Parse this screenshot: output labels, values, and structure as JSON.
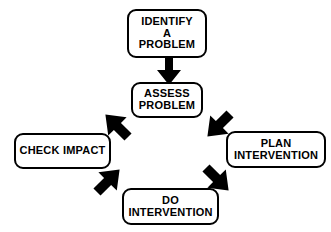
{
  "diagram": {
    "colors": {
      "background": "#ffffff",
      "stroke": "#000000",
      "node_fill": "#ffffff",
      "text": "#000000"
    },
    "nodes": [
      {
        "id": "identify",
        "name": "identify-a-problem",
        "lines": [
          "IDENTIFY",
          "A",
          "PROBLEM"
        ]
      },
      {
        "id": "assess",
        "name": "assess-problem",
        "lines": [
          "ASSESS",
          "PROBLEM"
        ]
      },
      {
        "id": "plan",
        "name": "plan-intervention",
        "lines": [
          "PLAN",
          "INTERVENTION"
        ]
      },
      {
        "id": "do",
        "name": "do-intervention",
        "lines": [
          "DO",
          "INTERVENTION"
        ]
      },
      {
        "id": "check",
        "name": "check-impact",
        "lines": [
          "CHECK IMPACT"
        ]
      }
    ],
    "arrows": [
      {
        "id": "down",
        "from": "identify",
        "to": "assess",
        "direction": "down"
      },
      {
        "id": "ne",
        "from": "assess",
        "to": "plan",
        "direction": "down-right"
      },
      {
        "id": "se",
        "from": "plan",
        "to": "do",
        "direction": "down-left"
      },
      {
        "id": "sw",
        "from": "do",
        "to": "check",
        "direction": "up-left"
      },
      {
        "id": "nw",
        "from": "check",
        "to": "assess",
        "direction": "up-right"
      }
    ]
  }
}
